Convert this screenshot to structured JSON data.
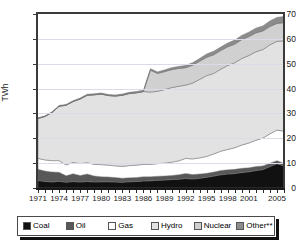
{
  "chart_data": {
    "type": "area",
    "stacked": true,
    "title": "",
    "xlabel": "",
    "ylabel": "TWh",
    "ylim": [
      0,
      70
    ],
    "yticks": [
      0,
      10,
      20,
      30,
      40,
      50,
      60,
      70
    ],
    "xlim": [
      1971,
      2006
    ],
    "xtick_labels": [
      "1971",
      "1974",
      "1977",
      "1980",
      "1983",
      "1986",
      "1989",
      "1992",
      "1995",
      "1998",
      "2001",
      "2005"
    ],
    "xtick_values": [
      1971,
      1974,
      1977,
      1980,
      1983,
      1986,
      1989,
      1992,
      1995,
      1998,
      2001,
      2005
    ],
    "grid": true,
    "grid_axis": "y",
    "legend_position": "bottom",
    "x": [
      1971,
      1972,
      1973,
      1974,
      1975,
      1976,
      1977,
      1978,
      1979,
      1980,
      1981,
      1982,
      1983,
      1984,
      1985,
      1986,
      1987,
      1988,
      1989,
      1990,
      1991,
      1992,
      1993,
      1994,
      1995,
      1996,
      1997,
      1998,
      1999,
      2000,
      2001,
      2002,
      2003,
      2004,
      2005,
      2006
    ],
    "series": [
      {
        "name": "Coal",
        "color": "#111111",
        "values": [
          3.0,
          2.6,
          2.4,
          2.7,
          2.3,
          2.6,
          2.4,
          2.6,
          2.4,
          2.5,
          2.5,
          2.4,
          2.3,
          2.5,
          2.6,
          2.8,
          2.9,
          3.1,
          3.2,
          3.4,
          3.5,
          3.8,
          3.6,
          3.9,
          4.3,
          4.8,
          5.3,
          5.6,
          5.8,
          6.2,
          6.5,
          7.0,
          7.4,
          8.6,
          9.8,
          8.9
        ]
      },
      {
        "name": "Oil",
        "color": "#585858",
        "values": [
          4.5,
          4.2,
          4.0,
          3.6,
          2.6,
          3.1,
          2.6,
          3.0,
          2.4,
          2.0,
          1.9,
          1.8,
          1.6,
          1.6,
          1.6,
          1.7,
          1.6,
          1.6,
          1.6,
          1.6,
          1.8,
          2.0,
          1.8,
          1.7,
          1.6,
          1.6,
          1.7,
          1.7,
          1.7,
          1.7,
          1.6,
          1.6,
          1.5,
          1.4,
          1.2,
          1.0
        ]
      },
      {
        "name": "Gas",
        "color": "#ffffff",
        "values": [
          4.4,
          4.5,
          4.6,
          4.7,
          4.4,
          4.6,
          4.8,
          4.6,
          4.7,
          4.9,
          4.8,
          4.7,
          4.8,
          4.9,
          5.0,
          5.0,
          5.0,
          5.1,
          5.2,
          5.4,
          5.6,
          6.1,
          6.3,
          6.5,
          6.8,
          7.3,
          7.8,
          8.2,
          8.7,
          9.4,
          10.0,
          10.6,
          11.2,
          11.8,
          12.3,
          13.0
        ]
      },
      {
        "name": "Hydro",
        "color": "#e2e2e2",
        "values": [
          16.1,
          17.5,
          19.4,
          21.9,
          24.0,
          24.5,
          26.0,
          27.1,
          28.0,
          28.4,
          28.0,
          28.1,
          28.6,
          29.0,
          29.1,
          29.3,
          29.1,
          29.1,
          29.6,
          30.0,
          30.0,
          29.5,
          30.5,
          31.6,
          32.5,
          32.4,
          33.0,
          33.8,
          34.2,
          34.8,
          35.2,
          35.6,
          35.6,
          35.8,
          35.7,
          36.3
        ]
      },
      {
        "name": "Nuclear",
        "color": "#d0d0d0",
        "values": [
          0,
          0,
          0,
          0,
          0,
          0,
          0,
          0,
          0,
          0,
          0,
          0,
          0,
          0,
          0,
          0,
          8.8,
          7.2,
          7.2,
          7.2,
          7.2,
          7.0,
          7.2,
          7.3,
          7.4,
          7.5,
          7.5,
          7.5,
          7.5,
          7.6,
          7.6,
          7.6,
          7.5,
          7.4,
          7.2,
          7.3
        ]
      },
      {
        "name": "Other**",
        "color": "#8c8c8c",
        "values": [
          0.2,
          0.2,
          0.2,
          0.3,
          0.3,
          0.3,
          0.4,
          0.4,
          0.4,
          0.4,
          0.4,
          0.4,
          0.5,
          0.5,
          0.5,
          0.5,
          0.6,
          0.6,
          0.7,
          0.8,
          0.8,
          0.9,
          1.0,
          1.1,
          1.3,
          1.4,
          1.4,
          1.5,
          1.6,
          1.7,
          1.8,
          1.9,
          2.0,
          2.2,
          2.4,
          2.5
        ]
      }
    ]
  },
  "axis": {
    "ylabel": "TWh"
  },
  "legend": {
    "items": [
      {
        "label": "Coal",
        "color": "#111111"
      },
      {
        "label": "Oil",
        "color": "#585858"
      },
      {
        "label": "Gas",
        "color": "#ffffff"
      },
      {
        "label": "Hydro",
        "color": "#e2e2e2"
      },
      {
        "label": "Nuclear",
        "color": "#d0d0d0"
      },
      {
        "label": "Other**",
        "color": "#8c8c8c"
      }
    ]
  }
}
